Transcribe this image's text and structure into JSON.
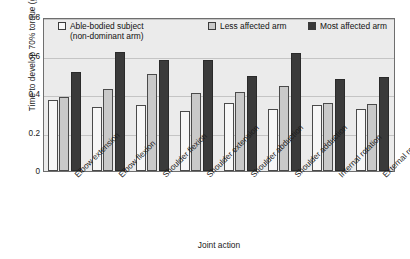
{
  "chart_data": {
    "type": "bar",
    "title": "",
    "xlabel": "Joint action",
    "ylabel": "Time to develop 70% torque (g)",
    "ylim": [
      0,
      0.8
    ],
    "yticks": [
      0,
      0.2,
      0.4,
      0.6,
      0.8
    ],
    "ytick_labels": [
      "0",
      "0.2",
      "0.4",
      "0.6",
      "0.8"
    ],
    "grid": true,
    "legend_position": "top-inside",
    "categories": [
      "Elbow extension",
      "Elbow flexion",
      "Shoulder flexion",
      "Shoulder extension",
      "Shoulder abduction",
      "Shoulder adduction",
      "Internal rotation",
      "External rotation"
    ],
    "series": [
      {
        "name": "Able-bodied subject",
        "name_line2": "(non-dominant arm)",
        "color": "#f7f7f7",
        "values": [
          0.37,
          0.33,
          0.345,
          0.31,
          0.355,
          0.32,
          0.345,
          0.32
        ]
      },
      {
        "name": "Less affected arm",
        "color": "#c9c9c9",
        "values": [
          0.385,
          0.425,
          0.505,
          0.405,
          0.41,
          0.44,
          0.355,
          0.35
        ]
      },
      {
        "name": "Most affected arm",
        "color": "#3a3a3a",
        "values": [
          0.515,
          0.62,
          0.575,
          0.575,
          0.495,
          0.615,
          0.48,
          0.49
        ]
      }
    ]
  },
  "colors": {
    "plot_background": "#ebebeb",
    "frame": "#6e6e6e",
    "gridline": "#c4c4c4",
    "page_background": "#ffffff",
    "text": "#1a1a1a"
  }
}
